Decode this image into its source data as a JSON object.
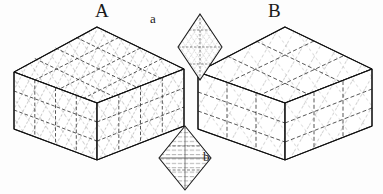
{
  "figure": {
    "type": "line-drawing",
    "background_color": "#fdfdfd",
    "ink_color": "#1a1a1a",
    "hatch_color": "#6f6f6f",
    "labels": [
      {
        "id": "A",
        "text": "A",
        "x": 95,
        "y": 1,
        "font_size": 19
      },
      {
        "id": "B",
        "text": "B",
        "x": 268,
        "y": 1,
        "font_size": 19
      },
      {
        "id": "a",
        "text": "a",
        "x": 150,
        "y": 12,
        "font_size": 13
      },
      {
        "id": "b",
        "text": "b",
        "x": 203,
        "y": 150,
        "font_size": 13
      }
    ]
  },
  "solids": {
    "A": {
      "name": "rhombohedron-A",
      "label": "A",
      "hatch_density": "dense",
      "top_face": [
        [
          97,
          27
        ],
        [
          184,
          69
        ],
        [
          97,
          103
        ],
        [
          14,
          72
        ]
      ],
      "left_face": [
        [
          14,
          72
        ],
        [
          97,
          103
        ],
        [
          97,
          160
        ],
        [
          14,
          129
        ]
      ],
      "right_face": [
        [
          97,
          103
        ],
        [
          184,
          69
        ],
        [
          184,
          126
        ],
        [
          97,
          160
        ]
      ],
      "top_divisions": 4,
      "side_divisions": 3
    },
    "B": {
      "name": "rhombohedron-B",
      "label": "B",
      "hatch_density": "sparse",
      "top_face": [
        [
          285,
          27
        ],
        [
          372,
          69
        ],
        [
          285,
          103
        ],
        [
          198,
          72
        ]
      ],
      "left_face": [
        [
          198,
          72
        ],
        [
          285,
          103
        ],
        [
          285,
          160
        ],
        [
          198,
          129
        ]
      ],
      "right_face": [
        [
          285,
          103
        ],
        [
          372,
          69
        ],
        [
          372,
          126
        ],
        [
          285,
          160
        ]
      ],
      "top_divisions": 3,
      "side_divisions": 3
    }
  },
  "cross_sections": {
    "a": {
      "name": "rhomb-section-a",
      "label": "a",
      "center": [
        200,
        47
      ],
      "half_width": 22,
      "half_height": 33,
      "pattern": "cross-hatch lattice",
      "line_count": 5
    },
    "b": {
      "name": "rhomb-section-b",
      "label": "b",
      "center": [
        185,
        158
      ],
      "half_width": 26,
      "half_height": 32,
      "pattern": "horizontal lamellae with vertical axis",
      "line_count": 7
    }
  }
}
